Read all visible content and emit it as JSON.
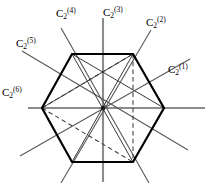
{
  "figure": {
    "shape": "regular-hexagon",
    "colors": {
      "hexagon_edge": "#000000",
      "axis_line": "#555555",
      "axis_highlight": "#8c8c8c",
      "chord_solid": "#333333",
      "chord_dashed": "#444444",
      "background": "#ffffff",
      "text": "#000000"
    },
    "geometry": {
      "center": [
        103,
        108
      ],
      "circumradius": 61,
      "vertices": [
        [
          164,
          108
        ],
        [
          133,
          54
        ],
        [
          72,
          54
        ],
        [
          42,
          108
        ],
        [
          72,
          162
        ],
        [
          133,
          162
        ]
      ]
    }
  },
  "axes": [
    {
      "id": "C2-1",
      "symbol": "C",
      "sub": "2",
      "sup": "(1)",
      "angle_deg": 30,
      "kind": "edge-midpoint-axis",
      "label_x": 168,
      "label_y": 63,
      "highlight": false
    },
    {
      "id": "C2-2",
      "symbol": "C",
      "sub": "2",
      "sup": "(2)",
      "angle_deg": 60,
      "kind": "vertex-axis",
      "label_x": 146,
      "label_y": 16,
      "highlight": false
    },
    {
      "id": "C2-3",
      "symbol": "C",
      "sub": "2",
      "sup": "(3)",
      "angle_deg": 90,
      "kind": "edge-midpoint-axis",
      "label_x": 103,
      "label_y": 6,
      "highlight": true
    },
    {
      "id": "C2-4",
      "symbol": "C",
      "sub": "2",
      "sup": "(4)",
      "angle_deg": 120,
      "kind": "vertex-axis",
      "label_x": 56,
      "label_y": 7,
      "highlight": false
    },
    {
      "id": "C2-5",
      "symbol": "C",
      "sub": "2",
      "sup": "(5)",
      "angle_deg": 150,
      "kind": "edge-midpoint-axis",
      "label_x": 16,
      "label_y": 37,
      "highlight": false
    },
    {
      "id": "C2-6",
      "symbol": "C",
      "sub": "2",
      "sup": "(6)",
      "angle_deg": 0,
      "kind": "vertex-axis",
      "label_x": 2,
      "label_y": 86,
      "highlight": true
    }
  ],
  "chords": {
    "solid": [
      [
        [
          72,
          54
        ],
        [
          133,
          162
        ]
      ],
      [
        [
          133,
          54
        ],
        [
          72,
          162
        ]
      ],
      [
        [
          72,
          54
        ],
        [
          164,
          108
        ]
      ],
      [
        [
          133,
          54
        ],
        [
          42,
          108
        ]
      ]
    ],
    "dashed": [
      [
        [
          42,
          108
        ],
        [
          133,
          54
        ]
      ],
      [
        [
          42,
          108
        ],
        [
          133,
          162
        ]
      ],
      [
        [
          133,
          54
        ],
        [
          133,
          162
        ]
      ]
    ]
  }
}
